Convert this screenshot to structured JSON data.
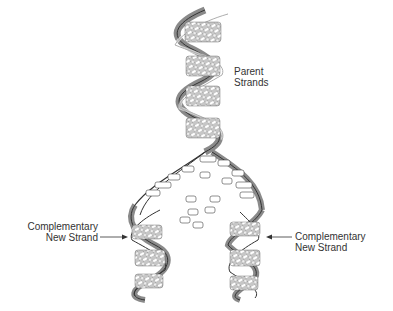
{
  "diagram": {
    "labels": {
      "parent": [
        "Parent",
        "Strands"
      ],
      "new_left": [
        "Complementary",
        "New Strand"
      ],
      "new_right": [
        "Complementary",
        "New Strand"
      ]
    },
    "base_pairs": [
      "A=T",
      "G≡C",
      "T=A",
      "C≡G"
    ],
    "free_nucleotides": [
      "T",
      "C",
      "A",
      "G",
      "T",
      "G",
      "C",
      "A",
      "G",
      "T"
    ],
    "colors": {
      "line": "#333333",
      "shade": "#8a8a8a",
      "background": "#ffffff"
    }
  }
}
